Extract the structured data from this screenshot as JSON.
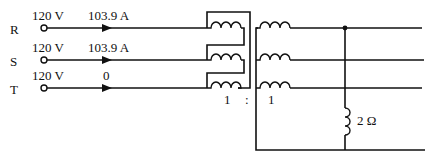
{
  "diagram": {
    "type": "three-phase transformer circuit",
    "phases": [
      {
        "name": "R",
        "voltage": "120 V",
        "current": "103.9 A"
      },
      {
        "name": "S",
        "voltage": "120 V",
        "current": "103.9 A"
      },
      {
        "name": "T",
        "voltage": "120 V",
        "current": "0"
      }
    ],
    "turns_ratio": {
      "primary": "1",
      "separator": ":",
      "secondary": "1"
    },
    "load": {
      "label": "2 Ω"
    }
  }
}
